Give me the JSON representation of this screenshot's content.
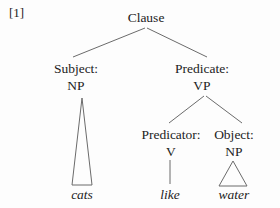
{
  "ref_label": "[1]",
  "tree": {
    "root": "Clause",
    "subject": {
      "role": "Subject:",
      "category": "NP",
      "leaf": "cats"
    },
    "predicate": {
      "role": "Predicate:",
      "category": "VP"
    },
    "predicator": {
      "role": "Predicator:",
      "category": "V",
      "leaf": "like"
    },
    "object": {
      "role": "Object:",
      "category": "NP",
      "leaf": "water"
    }
  },
  "colors": {
    "text": "#1c1c1c",
    "line": "#6b6b6b",
    "background": "#fdfdfd"
  }
}
